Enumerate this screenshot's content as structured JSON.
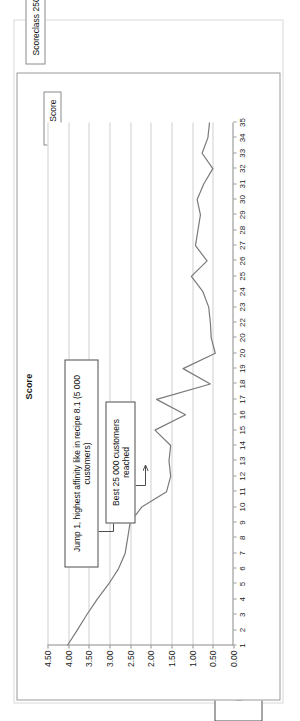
{
  "chart_data": {
    "type": "line",
    "title": "Score",
    "xlabel": "",
    "ylabel": "",
    "grid": true,
    "legend_position": "top-right",
    "legend": [
      "Score"
    ],
    "ylim": [
      0.0,
      4.5
    ],
    "yticks": [
      "4.50",
      "4.00",
      "3.50",
      "3.00",
      "2.50",
      "2.00",
      "1.50",
      "1.00",
      "0.50",
      "0.00"
    ],
    "ytick_values": [
      4.5,
      4.0,
      3.5,
      3.0,
      2.5,
      2.0,
      1.5,
      1.0,
      0.5,
      0.0
    ],
    "categories": [
      "1",
      "2",
      "3",
      "4",
      "5",
      "6",
      "7",
      "8",
      "9",
      "10",
      "11",
      "12",
      "13",
      "14",
      "15",
      "16",
      "17",
      "18",
      "19",
      "20",
      "20",
      "22",
      "23",
      "24",
      "25",
      "26",
      "27",
      "28",
      "29",
      "30",
      "31",
      "32",
      "33",
      "34",
      "35"
    ],
    "series": [
      {
        "name": "Score",
        "values": [
          4.02,
          3.78,
          3.55,
          3.3,
          3.02,
          2.78,
          2.62,
          2.56,
          2.5,
          2.22,
          1.62,
          1.52,
          1.56,
          1.52,
          1.9,
          1.16,
          1.86,
          0.56,
          1.22,
          0.44,
          0.54,
          0.56,
          0.6,
          0.74,
          1.02,
          0.64,
          0.92,
          0.86,
          0.8,
          0.88,
          0.72,
          0.5,
          0.76,
          0.62,
          0.58
        ]
      }
    ],
    "annotations": [
      {
        "id": "jump",
        "text": "Jump 1, highest affinity like in recipe 8.1  (5 000 customers)",
        "points_to_category": "5"
      },
      {
        "id": "best",
        "text": "Best 25 000 customers reached",
        "points_to_category": "10"
      }
    ]
  },
  "page": {
    "lift_badge": "Lift",
    "caption": "Scoreclass 2500 each,descending score"
  },
  "colors": {
    "series_line": "#7a7a7a",
    "grid": "#cfcfcf",
    "axis": "#8a8a8a",
    "callout_border": "#4d4d4d",
    "text": "#111111",
    "page_border": "#d9d9d9",
    "card_border": "#9a9a9a"
  }
}
